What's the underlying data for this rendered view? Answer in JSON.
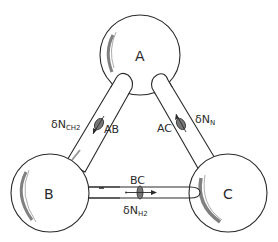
{
  "diagram": {
    "type": "three-reservoir diffusion network",
    "nodes": [
      {
        "id": "A",
        "label": "A"
      },
      {
        "id": "B",
        "label": "B"
      },
      {
        "id": "C",
        "label": "C"
      }
    ],
    "edges": [
      {
        "id": "AB",
        "label": "AB",
        "from": "A",
        "to": "B",
        "flux_symbol": "δN",
        "flux_subscript": "CH2",
        "arrow_direction": "toward B"
      },
      {
        "id": "AC",
        "label": "AC",
        "from": "C",
        "to": "A",
        "flux_symbol": "δN",
        "flux_subscript": "N",
        "arrow_direction": "toward A"
      },
      {
        "id": "BC",
        "label": "BC",
        "from": "B",
        "to": "C",
        "flux_symbol": "δN",
        "flux_subscript": "H2",
        "arrow_direction": "toward C"
      }
    ],
    "colors": {
      "line": "#2a2a2a",
      "shading": "#555555",
      "background": "#ffffff"
    }
  }
}
